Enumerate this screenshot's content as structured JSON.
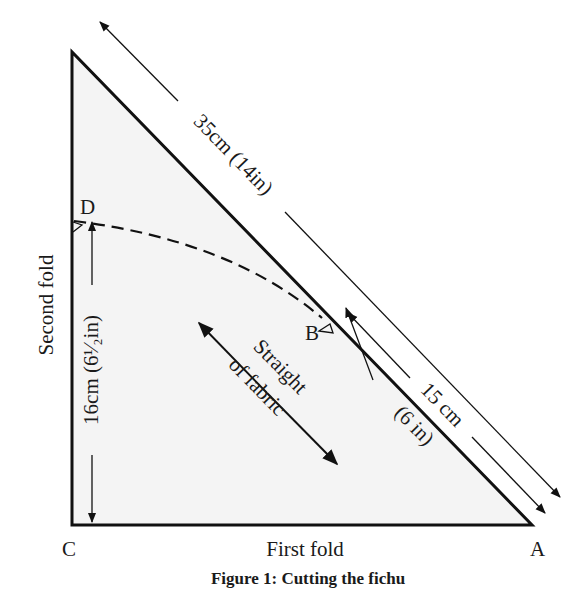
{
  "diagram": {
    "title": "Figure 1: Cutting the fichu",
    "colors": {
      "fill": "#f4f4f4",
      "stroke": "#111111",
      "background": "#ffffff"
    },
    "vertices": {
      "apex": "",
      "C": "C",
      "A": "A",
      "B": "B",
      "D": "D"
    },
    "edges": {
      "bottom": "First fold",
      "left": "Second fold"
    },
    "dimensions": {
      "hypotenuse": "35cm (14in)",
      "segment_BA_line1": "15 cm",
      "segment_BA_line2": "(6 in)",
      "segment_CD": "16cm (6¹⁄₂in)"
    },
    "grain": {
      "line1": "Straight",
      "line2": "of fabric"
    },
    "curve": "dashed cutting line from D to B"
  }
}
